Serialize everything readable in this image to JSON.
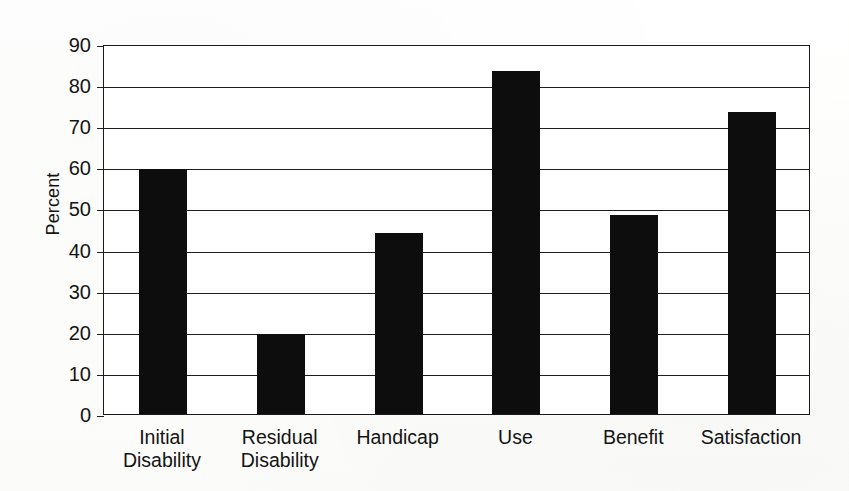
{
  "chart_data": {
    "type": "bar",
    "title": "",
    "subtitle": "",
    "xlabel": "",
    "ylabel": "Percent",
    "ylim": [
      0,
      90
    ],
    "ytick_step": 10,
    "grid": true,
    "legend": "none",
    "orientation": "vertical",
    "bar_color": "#0d0d0d",
    "categories": [
      "Initial\nDisability",
      "Residual\nDisability",
      "Handicap",
      "Use",
      "Benefit",
      "Satisfaction"
    ],
    "values": [
      59.5,
      19.5,
      44,
      83.5,
      48.5,
      73.5
    ],
    "ytick_labels": [
      "90",
      "80",
      "70",
      "60",
      "50",
      "40",
      "30",
      "20",
      "10",
      "0"
    ],
    "ytick_values": [
      90,
      80,
      70,
      60,
      50,
      40,
      30,
      20,
      10,
      0
    ]
  },
  "axis": {
    "y_title": "Percent"
  }
}
